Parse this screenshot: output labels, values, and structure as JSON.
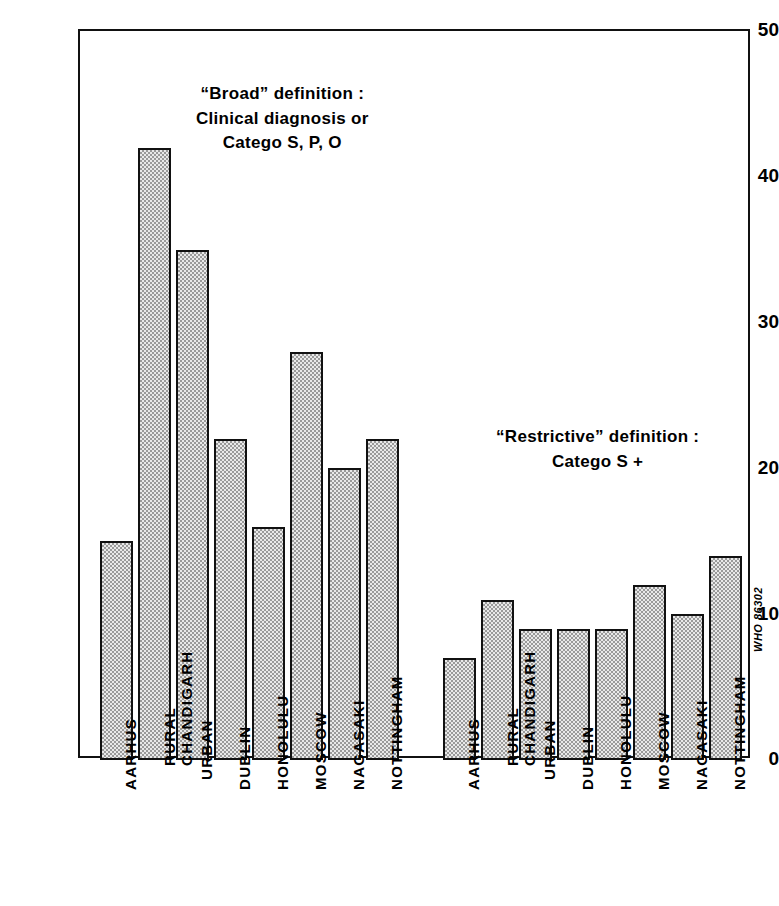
{
  "chart_data": {
    "type": "bar",
    "title": "",
    "xlabel": "",
    "ylabel": "Cases per 100,000",
    "ylim": [
      0,
      50
    ],
    "yticks": [
      0,
      10,
      20,
      30,
      40,
      50
    ],
    "grid": false,
    "legend_position": "none",
    "categories": [
      "AARHUS",
      "RURAL CHANDIGARH",
      "URBAN CHANDIGARH",
      "DUBLIN",
      "HONOLULU",
      "MOSCOW",
      "NAGASAKI",
      "NOTTINGHAM"
    ],
    "series": [
      {
        "name": "\"Broad\" definition : Clinical diagnosis or Catego S, P, O",
        "values": [
          15,
          42,
          35,
          22,
          16,
          28,
          20,
          22
        ]
      },
      {
        "name": "\"Restrictive\" definition : Catego S +",
        "values": [
          7,
          11,
          9,
          9,
          9,
          12,
          10,
          14
        ]
      }
    ],
    "annotations": [
      {
        "id": "broad",
        "lines": [
          "“Broad” definition :",
          "Clinical diagnosis or",
          "Catego S, P, O"
        ]
      },
      {
        "id": "restrictive",
        "lines": [
          "“Restrictive” definition :",
          "Catego S +"
        ]
      }
    ]
  },
  "axis": {
    "y_title": "C a s e s   p e r   1 0 0 , 0 0 0",
    "tick_labels": [
      "50",
      "40",
      "30",
      "20",
      "10",
      "0"
    ]
  },
  "category_labels": [
    {
      "lines": [
        "AARHUS"
      ]
    },
    {
      "lines": [
        "RURAL",
        "CHANDIGARH"
      ]
    },
    {
      "lines": [
        "URBAN"
      ]
    },
    {
      "lines": [
        "DUBLIN"
      ]
    },
    {
      "lines": [
        "HONOLULU"
      ]
    },
    {
      "lines": [
        "MOSCOW"
      ]
    },
    {
      "lines": [
        "NAGASAKI"
      ]
    },
    {
      "lines": [
        "NOTTINGHAM"
      ]
    }
  ],
  "credit": "WHO 86302",
  "colors": {
    "ink": "#111111",
    "bar_fill_light": "#e9e9e9",
    "bar_fill_dot": "#9a9a9a",
    "background": "#ffffff"
  }
}
